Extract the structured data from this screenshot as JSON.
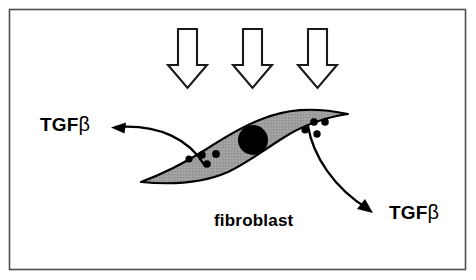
{
  "figure": {
    "background_color": "#ffffff",
    "frame": {
      "name": "figure-border",
      "stroke_color": "#4d4d4d",
      "x": 9,
      "y": 9,
      "width": 457,
      "height": 261
    }
  },
  "stimulus_arrows": {
    "count": 3,
    "description": "three hollow block arrows pointing down onto the cell",
    "fill_color": "#ffffff",
    "stroke_color": "#1a1a1a",
    "items": [
      {
        "name": "stimulus-arrow-1",
        "center_x": 188,
        "top": 28,
        "bottom": 88
      },
      {
        "name": "stimulus-arrow-2",
        "center_x": 253,
        "top": 28,
        "bottom": 88
      },
      {
        "name": "stimulus-arrow-3",
        "center_x": 318,
        "top": 28,
        "bottom": 88
      }
    ]
  },
  "cell": {
    "name": "fibroblast-cell",
    "label": "fibroblast",
    "body_fill_color": "#9e9e9e",
    "body_stroke_color": "#000000",
    "nucleus": {
      "name": "cell-nucleus",
      "fill_color": "#000000",
      "center_x": 253,
      "center_y": 140,
      "radius": 15
    },
    "granules": {
      "name": "cytoplasmic-granules",
      "fill_color": "#000000",
      "count": 8,
      "left_cluster": [
        {
          "cx": 189,
          "cy": 159
        },
        {
          "cx": 202,
          "cy": 155
        },
        {
          "cx": 207,
          "cy": 163
        },
        {
          "cx": 215,
          "cy": 154
        }
      ],
      "right_cluster": [
        {
          "cx": 306,
          "cy": 129
        },
        {
          "cx": 314,
          "cy": 122
        },
        {
          "cx": 324,
          "cy": 122
        },
        {
          "cx": 317,
          "cy": 133
        }
      ]
    }
  },
  "secretion_arrows": [
    {
      "name": "secretion-arrow-left",
      "direction": "left",
      "target_label": "TGFβ",
      "tip_x": 112,
      "tip_y": 128
    },
    {
      "name": "secretion-arrow-right",
      "direction": "down-right",
      "target_label": "TGFβ",
      "tip_x": 372,
      "tip_y": 213
    }
  ],
  "labels": {
    "tgfb_left": {
      "prefix": "TGF",
      "greek": "β"
    },
    "tgfb_right": {
      "prefix": "TGF",
      "greek": "β"
    },
    "fibroblast": "fibroblast"
  }
}
